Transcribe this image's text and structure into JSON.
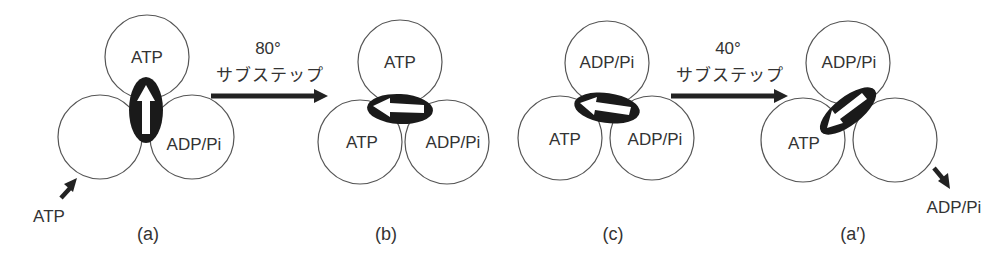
{
  "diagram": {
    "panels": [
      {
        "id": "a",
        "caption": "(a)",
        "subunits": {
          "top": "ATP",
          "left": "",
          "right": "ADP/Pi"
        },
        "gamma_direction": "up",
        "external_label": "ATP",
        "external_arrow": "in"
      },
      {
        "id": "b",
        "caption": "(b)",
        "subunits": {
          "top": "ATP",
          "left": "ATP",
          "right": "ADP/Pi"
        },
        "gamma_direction": "left"
      },
      {
        "id": "c",
        "caption": "(c)",
        "subunits": {
          "top": "ADP/Pi",
          "left": "ATP",
          "right": "ADP/Pi"
        },
        "gamma_direction": "left"
      },
      {
        "id": "a_prime",
        "caption": "(a′)",
        "subunits": {
          "top": "ADP/Pi",
          "left": "ATP",
          "right": ""
        },
        "gamma_direction": "down-left",
        "external_label": "ADP/Pi",
        "external_arrow": "out"
      }
    ],
    "transitions": [
      {
        "from": "a",
        "to": "b",
        "angle": "80°",
        "label": "サブステップ"
      },
      {
        "from": "c",
        "to": "a_prime",
        "angle": "40°",
        "label": "サブステップ"
      }
    ]
  }
}
